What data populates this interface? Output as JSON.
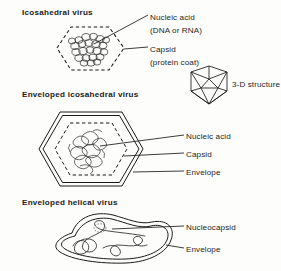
{
  "figure": {
    "background_color": "#fdfdfc",
    "ink_color": "#1a1a1a"
  },
  "panels": [
    {
      "id": "icosahedral-virus",
      "heading": "Icosahedral virus",
      "labels": [
        {
          "id": "nucleic-acid",
          "line_1": "Nucleic acid",
          "line_2": "(DNA or RNA)"
        },
        {
          "id": "capsid",
          "line_1": "Capsid",
          "line_2": "(protein coat)"
        }
      ]
    },
    {
      "id": "three-d-structure",
      "label": "3-D structure"
    },
    {
      "id": "enveloped-icosahedral-virus",
      "heading": "Enveloped icosahedral virus",
      "labels": [
        {
          "id": "nucleic-acid",
          "line_1": "Nucleic acid"
        },
        {
          "id": "capsid",
          "line_1": "Capsid"
        },
        {
          "id": "envelope",
          "line_1": "Envelope"
        }
      ]
    },
    {
      "id": "enveloped-helical-virus",
      "heading": "Enveloped helical virus",
      "labels": [
        {
          "id": "nucleocapsid",
          "line_1": "Nucleocapsid"
        },
        {
          "id": "envelope",
          "line_1": "Envelope"
        }
      ]
    }
  ]
}
